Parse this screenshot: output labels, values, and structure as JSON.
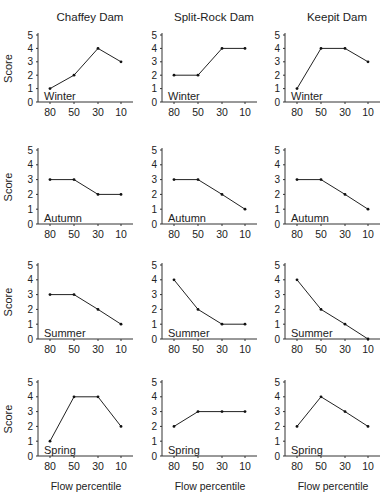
{
  "figure": {
    "columns": [
      "Chaffey Dam",
      "Split-Rock Dam",
      "Keepit Dam"
    ],
    "rows": [
      "Winter",
      "Autumn",
      "Summer",
      "Spring"
    ],
    "ylabel": "Score",
    "xlabel": "Flow percentile",
    "xticks": [
      "80",
      "50",
      "30",
      "10"
    ],
    "yticks": [
      "0",
      "1",
      "2",
      "3",
      "4",
      "5"
    ]
  },
  "chart_data": [
    {
      "type": "line",
      "title": "Chaffey Dam",
      "panel_label": "Winter",
      "categories": [
        "80",
        "50",
        "30",
        "10"
      ],
      "values": [
        1,
        2,
        4,
        3
      ],
      "xlabel": "",
      "ylabel": "Score",
      "ylim": [
        0,
        5
      ],
      "grid": false
    },
    {
      "type": "line",
      "title": "Split-Rock Dam",
      "panel_label": "Winter",
      "categories": [
        "80",
        "50",
        "30",
        "10"
      ],
      "values": [
        2,
        2,
        4,
        4
      ],
      "xlabel": "",
      "ylabel": "",
      "ylim": [
        0,
        5
      ],
      "grid": false
    },
    {
      "type": "line",
      "title": "Keepit Dam",
      "panel_label": "Winter",
      "categories": [
        "80",
        "50",
        "30",
        "10"
      ],
      "values": [
        1,
        4,
        4,
        3
      ],
      "xlabel": "",
      "ylabel": "",
      "ylim": [
        0,
        5
      ],
      "grid": false
    },
    {
      "type": "line",
      "title": "",
      "panel_label": "Autumn",
      "categories": [
        "80",
        "50",
        "30",
        "10"
      ],
      "values": [
        3,
        3,
        2,
        2
      ],
      "xlabel": "",
      "ylabel": "Score",
      "ylim": [
        0,
        5
      ],
      "grid": false
    },
    {
      "type": "line",
      "title": "",
      "panel_label": "Autumn",
      "categories": [
        "80",
        "50",
        "30",
        "10"
      ],
      "values": [
        3,
        3,
        2,
        1
      ],
      "xlabel": "",
      "ylabel": "",
      "ylim": [
        0,
        5
      ],
      "grid": false
    },
    {
      "type": "line",
      "title": "",
      "panel_label": "Autumn",
      "categories": [
        "80",
        "50",
        "30",
        "10"
      ],
      "values": [
        3,
        3,
        2,
        1
      ],
      "xlabel": "",
      "ylabel": "",
      "ylim": [
        0,
        5
      ],
      "grid": false
    },
    {
      "type": "line",
      "title": "",
      "panel_label": "Summer",
      "categories": [
        "80",
        "50",
        "30",
        "10"
      ],
      "values": [
        3,
        3,
        2,
        1
      ],
      "xlabel": "",
      "ylabel": "Score",
      "ylim": [
        0,
        5
      ],
      "grid": false
    },
    {
      "type": "line",
      "title": "",
      "panel_label": "Summer",
      "categories": [
        "80",
        "50",
        "30",
        "10"
      ],
      "values": [
        4,
        2,
        1,
        1
      ],
      "xlabel": "",
      "ylabel": "",
      "ylim": [
        0,
        5
      ],
      "grid": false
    },
    {
      "type": "line",
      "title": "",
      "panel_label": "Summer",
      "categories": [
        "80",
        "50",
        "30",
        "10"
      ],
      "values": [
        4,
        2,
        1,
        0
      ],
      "xlabel": "",
      "ylabel": "",
      "ylim": [
        0,
        5
      ],
      "grid": false
    },
    {
      "type": "line",
      "title": "",
      "panel_label": "Spring",
      "categories": [
        "80",
        "50",
        "30",
        "10"
      ],
      "values": [
        1,
        4,
        4,
        2
      ],
      "xlabel": "Flow percentile",
      "ylabel": "Score",
      "ylim": [
        0,
        5
      ],
      "grid": false
    },
    {
      "type": "line",
      "title": "",
      "panel_label": "Spring",
      "categories": [
        "80",
        "50",
        "30",
        "10"
      ],
      "values": [
        2,
        3,
        3,
        3
      ],
      "xlabel": "Flow percentile",
      "ylabel": "",
      "ylim": [
        0,
        5
      ],
      "grid": false
    },
    {
      "type": "line",
      "title": "",
      "panel_label": "Spring",
      "categories": [
        "80",
        "50",
        "30",
        "10"
      ],
      "values": [
        2,
        4,
        3,
        2
      ],
      "xlabel": "Flow percentile",
      "ylabel": "",
      "ylim": [
        0,
        5
      ],
      "grid": false
    }
  ]
}
